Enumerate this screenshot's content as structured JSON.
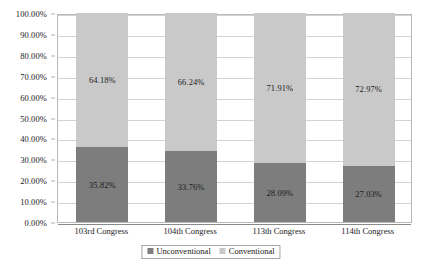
{
  "chart_data": {
    "type": "bar",
    "subtype": "100% stacked bar",
    "title": "",
    "xlabel": "",
    "ylabel": "",
    "ylim": [
      0,
      100
    ],
    "grid": true,
    "legend_position": "bottom-center",
    "categories": [
      "103rd Congress",
      "104th Congress",
      "113th Congress",
      "114th Congress"
    ],
    "y_ticks": [
      "0.00%",
      "10.00%",
      "20.00%",
      "30.00%",
      "40.00%",
      "50.00%",
      "60.00%",
      "70.00%",
      "80.00%",
      "90.00%",
      "100.00%"
    ],
    "y_tick_values": [
      0,
      10,
      20,
      30,
      40,
      50,
      60,
      70,
      80,
      90,
      100
    ],
    "series": [
      {
        "name": "Unconventional",
        "color": "#7d7d7d",
        "values": [
          35.82,
          33.76,
          28.09,
          27.03
        ],
        "labels": [
          "35.82%",
          "33.76%",
          "28.09%",
          "27.03%"
        ]
      },
      {
        "name": "Conventional",
        "color": "#c9c9c9",
        "values": [
          64.18,
          66.24,
          71.91,
          72.97
        ],
        "labels": [
          "64.18%",
          "66.24%",
          "71.91%",
          "72.97%"
        ]
      }
    ]
  },
  "legend": {
    "entries": [
      {
        "label": "Unconventional",
        "color": "#7d7d7d"
      },
      {
        "label": "Conventional",
        "color": "#c9c9c9"
      }
    ]
  }
}
